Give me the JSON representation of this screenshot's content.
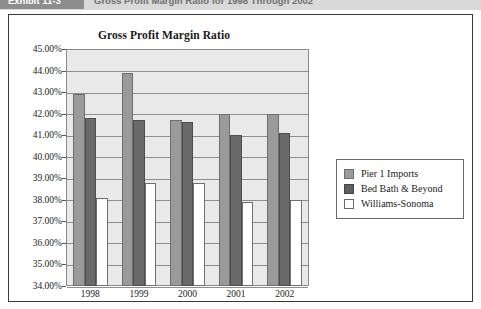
{
  "exhibit_header": {
    "tab_label": "Exhibit 11-3",
    "title": "Gross Profit Margin Ratio for 1998 Through 2002"
  },
  "legend": {
    "position": "right",
    "entries": [
      {
        "label": "Pier 1 Imports",
        "color": "#9a9a9a",
        "swatch": "filled-medium-gray"
      },
      {
        "label": "Bed Bath & Beyond",
        "color": "#5f5f5f",
        "swatch": "filled-dark-gray"
      },
      {
        "label": "Williams-Sonoma",
        "color": "#ffffff",
        "swatch": "outlined-white"
      }
    ]
  },
  "chart_data": {
    "type": "bar",
    "title": "Gross Profit Margin Ratio",
    "xlabel": "",
    "ylabel": "",
    "categories": [
      "1998",
      "1999",
      "2000",
      "2001",
      "2002"
    ],
    "series": [
      {
        "name": "Pier 1 Imports",
        "color": "#9a9a9a",
        "values": [
          42.9,
          43.9,
          41.7,
          42.0,
          42.0
        ]
      },
      {
        "name": "Bed Bath & Beyond",
        "color": "#5f5f5f",
        "values": [
          41.8,
          41.7,
          41.6,
          41.0,
          41.1
        ]
      },
      {
        "name": "Williams-Sonoma",
        "color": "#ffffff",
        "values": [
          38.1,
          38.8,
          38.8,
          37.9,
          38.0
        ]
      }
    ],
    "ylim": [
      34.0,
      45.0
    ],
    "ytick_step": 1.0,
    "ytick_labels": [
      "45.00%",
      "44.00%",
      "43.00%",
      "42.00%",
      "41.00%",
      "40.00%",
      "39.00%",
      "38.00%",
      "37.00%",
      "36.00%",
      "35.00%",
      "34.00%"
    ],
    "grid": true,
    "plot_background": "#e9e9e9"
  }
}
